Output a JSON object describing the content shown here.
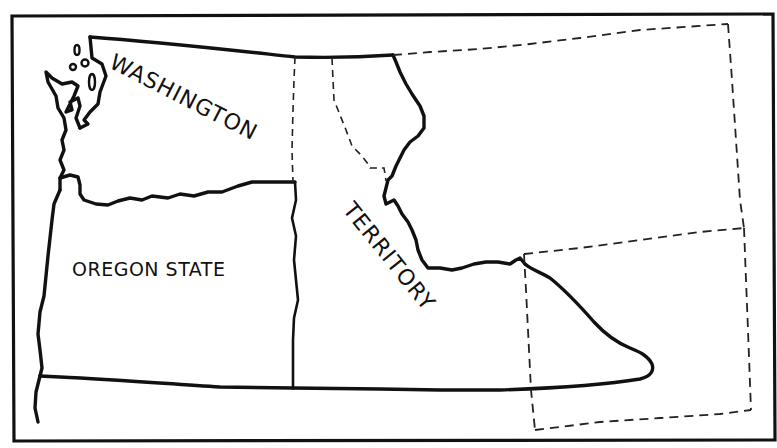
{
  "map": {
    "labels": {
      "washington": "WASHINGTON",
      "territory": "TERRITORY",
      "oregon": "OREGON STATE"
    },
    "colors": {
      "ink": "#111111",
      "background": "#ffffff"
    },
    "regions": [
      {
        "name": "Oregon State",
        "boundary": "solid"
      },
      {
        "name": "Washington Territory",
        "boundary": "solid"
      },
      {
        "name": "Eastern territory (dashed sub-boundaries)",
        "boundary": "dashed"
      }
    ]
  }
}
